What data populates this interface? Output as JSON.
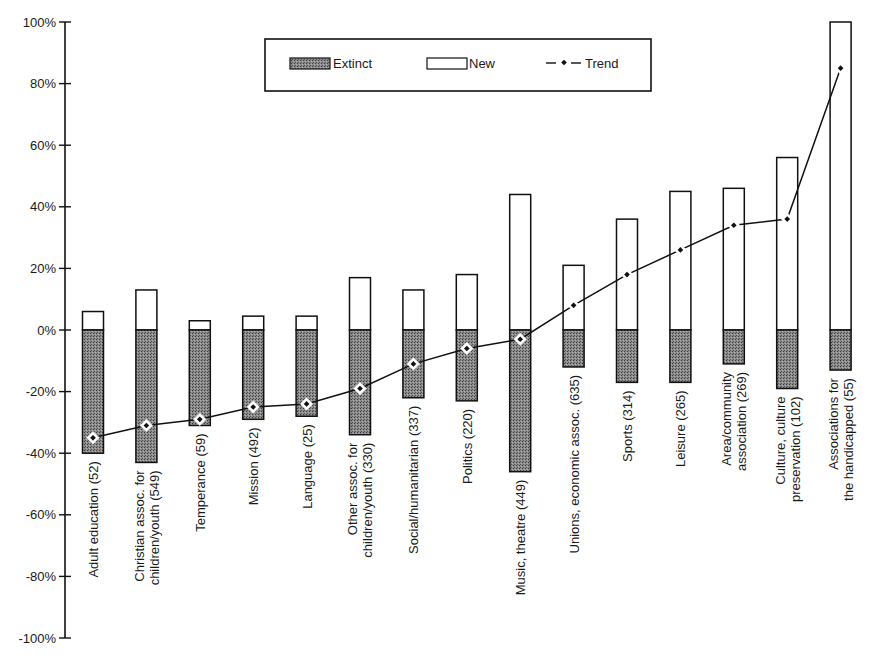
{
  "chart_data": {
    "type": "bar",
    "title": "",
    "xlabel": "",
    "ylabel": "",
    "ylim": [
      -100,
      100
    ],
    "yticks": [
      100,
      80,
      60,
      40,
      20,
      0,
      -20,
      -40,
      -60,
      -80,
      -100
    ],
    "ytick_labels": [
      "100%",
      "80%",
      "60%",
      "40%",
      "20%",
      "0%",
      "-20%",
      "-40%",
      "-60%",
      "-80%",
      "-100%"
    ],
    "grid": false,
    "legend_position": "top-center",
    "legend": [
      {
        "name": "Extinct",
        "style": "dark-stippled-bar"
      },
      {
        "name": "New",
        "style": "white-bar"
      },
      {
        "name": "Trend",
        "style": "line-with-diamond-markers"
      }
    ],
    "categories": [
      [
        "Adult education (52)"
      ],
      [
        "Christian assoc. for",
        "children/youth (549)"
      ],
      [
        "Temperance (59)"
      ],
      [
        "Mission (492)"
      ],
      [
        "Language (25)"
      ],
      [
        "Other assoc. for",
        "children/youth (330)"
      ],
      [
        "Social/humanitarian (337)"
      ],
      [
        "Politics (220)"
      ],
      [
        "Music, theatre (449)"
      ],
      [
        "Unions, economic assoc. (635)"
      ],
      [
        "Sports (314)"
      ],
      [
        "Leisure (265)"
      ],
      [
        "Area/community",
        "association (269)"
      ],
      [
        "Culture, culture",
        "preservation (102)"
      ],
      [
        "Associations for",
        "the handicapped (55)"
      ]
    ],
    "series": [
      {
        "name": "Extinct",
        "type": "bar",
        "values": [
          -40,
          -43,
          -31,
          -29,
          -28,
          -34,
          -22,
          -23,
          -46,
          -12,
          -17,
          -17,
          -11,
          -19,
          -13
        ]
      },
      {
        "name": "New",
        "type": "bar",
        "values": [
          6,
          13,
          3,
          4.5,
          4.5,
          17,
          13,
          18,
          44,
          21,
          36,
          45,
          46,
          56,
          100
        ]
      },
      {
        "name": "Trend",
        "type": "line",
        "values": [
          -35,
          -31,
          -29,
          -25,
          -24,
          -19,
          -11,
          -6,
          -3,
          8,
          18,
          26,
          34,
          36,
          85
        ]
      }
    ]
  }
}
